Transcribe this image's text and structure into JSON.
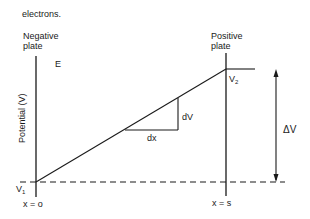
{
  "caption_fragment": "electrons.",
  "negative_plate": {
    "line1": "Negative",
    "line2": "plate"
  },
  "positive_plate": {
    "line1": "Positive",
    "line2": "plate"
  },
  "field_label": "E",
  "y_axis_label": "Potential  (V)",
  "v1": {
    "main": "V",
    "sub": "1"
  },
  "v2": {
    "main": "V",
    "sub": "2"
  },
  "dv_label": "dV",
  "dx_label": "dx",
  "delta_v_label": "ΔV",
  "x_left_label": "x  =  o",
  "x_right_label": "x  =  s",
  "colors": {
    "stroke": "#1a1a1a",
    "background": "#ffffff"
  }
}
